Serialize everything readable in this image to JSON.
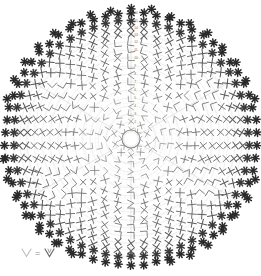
{
  "document": {
    "type": "crochet-pattern-chart",
    "title": "Circular crochet doily stitch chart",
    "background_color": "#ffffff"
  },
  "colors": {
    "guide_arc": "#d8d8d8",
    "guide_spoke": "#e2e2e2",
    "stitch_light": "#9a9a9a",
    "stitch_mid": "#6e6e6e",
    "stitch_dark": "#3a3a3a",
    "edge_symbol": "#2a2a2a",
    "legend_light": "#b4b4b4",
    "legend_dark": "#555555",
    "round_number": "#707070"
  },
  "geometry": {
    "center_x": 131,
    "center_y": 139,
    "center_ring_radius": 9,
    "outer_radius": 126,
    "round_count": 16,
    "spoke_count": 6
  },
  "center": {
    "symbol": "chain-ring",
    "label": "magic ring"
  },
  "legend": {
    "left_symbol": "V",
    "equals": "=",
    "right_symbol": "V",
    "text": "V = V"
  },
  "round_numbers": [
    "1",
    "2",
    "3",
    "4",
    "5",
    "6",
    "7",
    "8",
    "9",
    "10",
    "11",
    "12",
    "13",
    "14",
    "15",
    "16"
  ],
  "symbols": {
    "single_crochet": "X",
    "double_crochet": "+",
    "picot_cluster": "asterisk",
    "chain_corner": "L",
    "chain_angle": "<",
    "v_stitch": "V"
  },
  "chart_data": {
    "type": "scatter",
    "xlabel": "",
    "ylabel": "",
    "grid": true,
    "legend_position": "bottom-left",
    "polar": true,
    "rounds": [
      {
        "round": 1,
        "radius": 9,
        "stitch_count": 8,
        "symbol": "X",
        "shade": "#8e8e8e"
      },
      {
        "round": 2,
        "radius": 17,
        "stitch_count": 10,
        "symbol": "X",
        "shade": "#8e8e8e"
      },
      {
        "round": 3,
        "radius": 25,
        "stitch_count": 12,
        "symbol": "<",
        "shade": "#7e7e7e"
      },
      {
        "round": 4,
        "radius": 33,
        "stitch_count": 14,
        "symbol": "L",
        "shade": "#7e7e7e"
      },
      {
        "round": 5,
        "radius": 41,
        "stitch_count": 18,
        "symbol": "L",
        "shade": "#7a7a7a"
      },
      {
        "round": 6,
        "radius": 49,
        "stitch_count": 22,
        "symbol": "X",
        "shade": "#787878"
      },
      {
        "round": 7,
        "radius": 57,
        "stitch_count": 26,
        "symbol": "+",
        "shade": "#767676"
      },
      {
        "round": 8,
        "radius": 65,
        "stitch_count": 30,
        "symbol": "+",
        "shade": "#747474"
      },
      {
        "round": 9,
        "radius": 73,
        "stitch_count": 34,
        "symbol": "X",
        "shade": "#727272"
      },
      {
        "round": 10,
        "radius": 81,
        "stitch_count": 38,
        "symbol": "X",
        "shade": "#6e6e6e"
      },
      {
        "round": 11,
        "radius": 89,
        "stitch_count": 42,
        "symbol": "X",
        "shade": "#6a6a6a"
      },
      {
        "round": 12,
        "radius": 97,
        "stitch_count": 46,
        "symbol": "X",
        "shade": "#666666"
      },
      {
        "round": 13,
        "radius": 104,
        "stitch_count": 50,
        "symbol": "X",
        "shade": "#5e5e5e"
      },
      {
        "round": 14,
        "radius": 111,
        "stitch_count": 54,
        "symbol": "X",
        "shade": "#555555"
      },
      {
        "round": 15,
        "radius": 118,
        "stitch_count": 58,
        "symbol": "asterisk",
        "shade": "#3a3a3a"
      },
      {
        "round": 16,
        "radius": 126,
        "stitch_count": 62,
        "symbol": "asterisk",
        "shade": "#2a2a2a"
      }
    ]
  }
}
